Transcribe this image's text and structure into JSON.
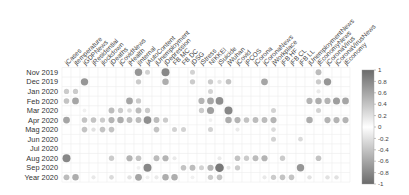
{
  "chart_data": {
    "type": "heatmap",
    "subtype": "correlation-circle-plot",
    "title": "",
    "xlabel": "",
    "ylabel": "",
    "columns": [
      "jCases",
      "jtemperature",
      "jGDPNews",
      "jResidential",
      "jlockdown",
      "jDeaths",
      "jCovidNews",
      "jHealth",
      "jInternal",
      "jAutoContent",
      "jUnemployment",
      "jDepression",
      "FB MC",
      "FB DC",
      "jDSG",
      "jStress",
      "NIKKEI",
      "jSuicide",
      "jWuhan",
      "jCovid",
      "jPCOS",
      "jCorona",
      "jCoronaNews",
      "jWorkplace",
      "jFB HF",
      "jFB CL",
      "jFB LL",
      "jUnemploymentNews",
      "jEconomyNews",
      "jCoronaVirus",
      "jCoronaVirusNews",
      "jEconomy"
    ],
    "rows": [
      "Nov 2019",
      "Dec 2019",
      "Jan 2020",
      "Feb 2020",
      "Mar 2020",
      "Apr 2020",
      "Mag 2020",
      "Jun 2020",
      "Jul 2020",
      "Aug 2020",
      "Sep 2020",
      "Year 2020"
    ],
    "cells": [
      {
        "r": 0,
        "c": 8,
        "v": 0.7
      },
      {
        "r": 0,
        "c": 9,
        "v": 0.3
      },
      {
        "r": 0,
        "c": 11,
        "v": 0.8
      },
      {
        "r": 0,
        "c": 14,
        "v": 0.3
      },
      {
        "r": 0,
        "c": 28,
        "v": 0.45
      },
      {
        "r": 1,
        "c": 2,
        "v": 0.7
      },
      {
        "r": 1,
        "c": 8,
        "v": 0.35
      },
      {
        "r": 1,
        "c": 11,
        "v": 0.55
      },
      {
        "r": 1,
        "c": 14,
        "v": 0.35
      },
      {
        "r": 1,
        "c": 16,
        "v": 0.35
      },
      {
        "r": 1,
        "c": 17,
        "v": 0.2
      },
      {
        "r": 1,
        "c": 18,
        "v": 0.4
      },
      {
        "r": 1,
        "c": 22,
        "v": 0.6
      },
      {
        "r": 1,
        "c": 28,
        "v": 0.35
      },
      {
        "r": 1,
        "c": 29,
        "v": 0.7
      },
      {
        "r": 2,
        "c": 0,
        "v": 0.35
      },
      {
        "r": 2,
        "c": 1,
        "v": 0.35
      },
      {
        "r": 2,
        "c": 16,
        "v": 0.3
      },
      {
        "r": 2,
        "c": 28,
        "v": 0.15
      },
      {
        "r": 3,
        "c": 0,
        "v": 0.4
      },
      {
        "r": 3,
        "c": 1,
        "v": 0.6
      },
      {
        "r": 3,
        "c": 7,
        "v": 0.6
      },
      {
        "r": 3,
        "c": 8,
        "v": 0.35
      },
      {
        "r": 3,
        "c": 15,
        "v": 0.5
      },
      {
        "r": 3,
        "c": 16,
        "v": 0.6
      },
      {
        "r": 3,
        "c": 17,
        "v": 0.75
      },
      {
        "r": 3,
        "c": 27,
        "v": 0.5
      },
      {
        "r": 3,
        "c": 28,
        "v": 0.55
      },
      {
        "r": 3,
        "c": 29,
        "v": 0.5
      },
      {
        "r": 3,
        "c": 30,
        "v": 0.65
      },
      {
        "r": 3,
        "c": 31,
        "v": 0.6
      },
      {
        "r": 4,
        "c": 2,
        "v": 0.1
      },
      {
        "r": 4,
        "c": 5,
        "v": 0.45
      },
      {
        "r": 4,
        "c": 6,
        "v": 0.35
      },
      {
        "r": 4,
        "c": 7,
        "v": 0.25
      },
      {
        "r": 4,
        "c": 8,
        "v": 0.45
      },
      {
        "r": 4,
        "c": 9,
        "v": 0.35
      },
      {
        "r": 4,
        "c": 15,
        "v": 0.35
      },
      {
        "r": 4,
        "c": 16,
        "v": 0.65
      },
      {
        "r": 4,
        "c": 18,
        "v": 0.8
      },
      {
        "r": 4,
        "c": 23,
        "v": 0.3
      },
      {
        "r": 4,
        "c": 28,
        "v": 0.3
      },
      {
        "r": 5,
        "c": 0,
        "v": 0.6
      },
      {
        "r": 5,
        "c": 2,
        "v": 0.4
      },
      {
        "r": 5,
        "c": 3,
        "v": 0.4
      },
      {
        "r": 5,
        "c": 4,
        "v": 0.35
      },
      {
        "r": 5,
        "c": 5,
        "v": 0.5
      },
      {
        "r": 5,
        "c": 6,
        "v": 0.55
      },
      {
        "r": 5,
        "c": 7,
        "v": 0.45
      },
      {
        "r": 5,
        "c": 8,
        "v": 0.45
      },
      {
        "r": 5,
        "c": 9,
        "v": 0.75
      },
      {
        "r": 5,
        "c": 10,
        "v": 0.45
      },
      {
        "r": 5,
        "c": 11,
        "v": 0.35
      },
      {
        "r": 5,
        "c": 16,
        "v": 0.1
      },
      {
        "r": 5,
        "c": 18,
        "v": 0.55
      },
      {
        "r": 5,
        "c": 19,
        "v": 0.5
      },
      {
        "r": 5,
        "c": 20,
        "v": 0.4
      },
      {
        "r": 5,
        "c": 21,
        "v": 0.45
      },
      {
        "r": 5,
        "c": 22,
        "v": 0.45
      },
      {
        "r": 5,
        "c": 23,
        "v": 0.5
      },
      {
        "r": 5,
        "c": 27,
        "v": 0.55
      },
      {
        "r": 5,
        "c": 29,
        "v": 0.5
      },
      {
        "r": 5,
        "c": 30,
        "v": 0.5
      },
      {
        "r": 5,
        "c": 31,
        "v": 0.5
      },
      {
        "r": 6,
        "c": 2,
        "v": 0.4
      },
      {
        "r": 6,
        "c": 3,
        "v": 0.2
      },
      {
        "r": 6,
        "c": 4,
        "v": 0.4
      },
      {
        "r": 6,
        "c": 5,
        "v": 0.4
      },
      {
        "r": 6,
        "c": 10,
        "v": 0.4
      },
      {
        "r": 6,
        "c": 12,
        "v": 0.3
      },
      {
        "r": 6,
        "c": 13,
        "v": 0.3
      },
      {
        "r": 6,
        "c": 16,
        "v": 0.3
      },
      {
        "r": 6,
        "c": 19,
        "v": 0.15
      },
      {
        "r": 6,
        "c": 23,
        "v": 0.25
      },
      {
        "r": 7,
        "c": 23,
        "v": 0.3
      },
      {
        "r": 7,
        "c": 26,
        "v": 0.25
      },
      {
        "r": 9,
        "c": 0,
        "v": 0.8
      },
      {
        "r": 9,
        "c": 5,
        "v": 0.35
      },
      {
        "r": 9,
        "c": 7,
        "v": 0.5
      },
      {
        "r": 9,
        "c": 8,
        "v": 0.4
      },
      {
        "r": 9,
        "c": 10,
        "v": 0.45
      },
      {
        "r": 9,
        "c": 11,
        "v": 0.5
      },
      {
        "r": 9,
        "c": 12,
        "v": 0.15
      },
      {
        "r": 9,
        "c": 17,
        "v": 0.15
      },
      {
        "r": 9,
        "c": 19,
        "v": 0.4
      },
      {
        "r": 9,
        "c": 20,
        "v": 0.35
      },
      {
        "r": 9,
        "c": 21,
        "v": 0.45
      },
      {
        "r": 9,
        "c": 22,
        "v": 0.5
      },
      {
        "r": 9,
        "c": 24,
        "v": 0.35
      },
      {
        "r": 9,
        "c": 28,
        "v": 0.4
      },
      {
        "r": 10,
        "c": 8,
        "v": 0.1
      },
      {
        "r": 10,
        "c": 9,
        "v": 0.8
      },
      {
        "r": 10,
        "c": 13,
        "v": 0.4
      },
      {
        "r": 10,
        "c": 14,
        "v": 0.45
      },
      {
        "r": 10,
        "c": 15,
        "v": 0.3
      },
      {
        "r": 10,
        "c": 16,
        "v": 0.5
      },
      {
        "r": 10,
        "c": 17,
        "v": 0.9
      },
      {
        "r": 10,
        "c": 18,
        "v": 0.15
      },
      {
        "r": 10,
        "c": 19,
        "v": 0.35
      },
      {
        "r": 10,
        "c": 26,
        "v": 0.7
      },
      {
        "r": 11,
        "c": 0,
        "v": 0.45
      },
      {
        "r": 11,
        "c": 1,
        "v": 0.55
      },
      {
        "r": 11,
        "c": 3,
        "v": 0.15
      },
      {
        "r": 11,
        "c": 5,
        "v": 0.25
      },
      {
        "r": 11,
        "c": 7,
        "v": 0.2
      },
      {
        "r": 11,
        "c": 8,
        "v": 0.6
      },
      {
        "r": 11,
        "c": 9,
        "v": 0.1
      },
      {
        "r": 11,
        "c": 10,
        "v": 0.15
      },
      {
        "r": 11,
        "c": 11,
        "v": 0.55
      },
      {
        "r": 11,
        "c": 12,
        "v": 0.55
      },
      {
        "r": 11,
        "c": 14,
        "v": 0.1
      },
      {
        "r": 11,
        "c": 16,
        "v": 0.35
      },
      {
        "r": 11,
        "c": 17,
        "v": 0.4
      },
      {
        "r": 11,
        "c": 22,
        "v": 0.15
      },
      {
        "r": 11,
        "c": 23,
        "v": 0.35
      },
      {
        "r": 11,
        "c": 24,
        "v": 0.4
      },
      {
        "r": 11,
        "c": 25,
        "v": 0.4
      },
      {
        "r": 11,
        "c": 27,
        "v": 0.2
      },
      {
        "r": 11,
        "c": 29,
        "v": 0.2
      },
      {
        "r": 11,
        "c": 30,
        "v": 0.2
      }
    ],
    "colorbar": {
      "ticks": [
        "1",
        "0.8",
        "0.6",
        "0.4",
        "0.2",
        "0",
        "-0.2",
        "-0.4",
        "-0.6",
        "-0.8",
        "-1"
      ],
      "range": [
        -1,
        1
      ],
      "color_high": "#6e6e6e",
      "color_mid": "#ffffff",
      "color_low": "#6e6e6e"
    },
    "legend_position": "right",
    "grid": true
  }
}
